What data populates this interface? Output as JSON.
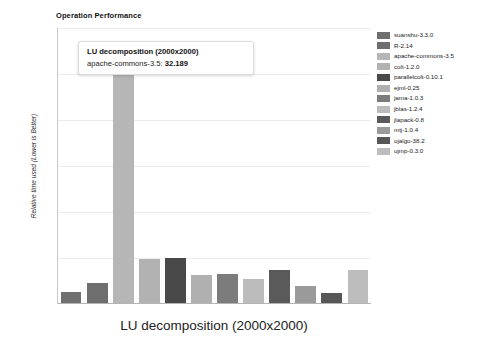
{
  "chart": {
    "title": "Operation Performance",
    "xlabel": "LU decomposition (2000x2000)",
    "ylabel": "Relative time used (Lower is Better)"
  },
  "tooltip": {
    "title": "LU decomposition (2000x2000)",
    "series_label": "apache-commons-3.5:",
    "value": "32.189"
  },
  "chart_data": {
    "type": "bar",
    "title": "Operation Performance",
    "xlabel": "LU decomposition (2000x2000)",
    "ylabel": "Relative time used (Lower is Better)",
    "grid": true,
    "legend_position": "right",
    "ylim": [
      0,
      35
    ],
    "categories": [
      "LU decomposition (2000x2000)"
    ],
    "series": [
      {
        "name": "suanshu-3.3.0",
        "values": [
          1.45
        ],
        "color": "#707070"
      },
      {
        "name": "R-2.14",
        "values": [
          2.55
        ],
        "color": "#6e6e6e"
      },
      {
        "name": "apache-commons-3.5",
        "values": [
          32.189
        ],
        "color": "#b6b6b6"
      },
      {
        "name": "colt-1.2.0",
        "values": [
          5.55
        ],
        "color": "#b2b2b2"
      },
      {
        "name": "parallelcolt-0.10.1",
        "values": [
          5.7
        ],
        "color": "#494949"
      },
      {
        "name": "ejml-0.25",
        "values": [
          3.55
        ],
        "color": "#b0b0b0"
      },
      {
        "name": "jama-1.0.3",
        "values": [
          3.75
        ],
        "color": "#7c7c7c"
      },
      {
        "name": "jblas-1.2.4",
        "values": [
          3.1
        ],
        "color": "#bcbcbc"
      },
      {
        "name": "jlapack-0.8",
        "values": [
          4.25
        ],
        "color": "#5a5a5a"
      },
      {
        "name": "mtj-1.0.4",
        "values": [
          2.2
        ],
        "color": "#9a9a9a"
      },
      {
        "name": "ojalgo-38.2",
        "values": [
          1.25
        ],
        "color": "#575757"
      },
      {
        "name": "ujmp-0.3.0",
        "values": [
          4.2
        ],
        "color": "#bdbdbd"
      }
    ],
    "gridline_values": [
      35.0,
      29.2,
      23.3,
      17.5,
      11.7,
      5.8
    ]
  },
  "legend": {
    "items": [
      {
        "label": "suanshu-3.3.0",
        "color": "#707070"
      },
      {
        "label": "R-2.14",
        "color": "#6e6e6e"
      },
      {
        "label": "apache-commons-3.5",
        "color": "#b6b6b6"
      },
      {
        "label": "colt-1.2.0",
        "color": "#b2b2b2"
      },
      {
        "label": "parallelcolt-0.10.1",
        "color": "#494949"
      },
      {
        "label": "ejml-0.25",
        "color": "#b0b0b0"
      },
      {
        "label": "jama-1.0.3",
        "color": "#7c7c7c"
      },
      {
        "label": "jblas-1.2.4",
        "color": "#bcbcbc"
      },
      {
        "label": "jlapack-0.8",
        "color": "#5a5a5a"
      },
      {
        "label": "mtj-1.0.4",
        "color": "#9a9a9a"
      },
      {
        "label": "ojalgo-38.2",
        "color": "#575757"
      },
      {
        "label": "ujmp-0.3.0",
        "color": "#bdbdbd"
      }
    ]
  }
}
